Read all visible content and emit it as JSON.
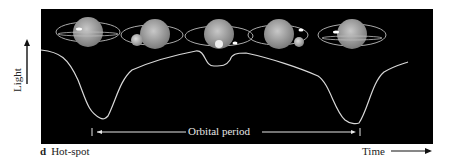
{
  "figure": {
    "panel_letter": "d",
    "caption": "Hot-spot",
    "y_axis_label": "Light",
    "x_axis_label": "Time",
    "period_label": "Orbital period",
    "colors": {
      "panel_bg": "#000000",
      "curve": "#d8d8d8",
      "planet": "#9a9a9a",
      "text": "#222222"
    }
  },
  "planets": [
    {
      "cx": 88,
      "cy": 32,
      "moon": "left-small",
      "label": "phase-1"
    },
    {
      "cx": 147,
      "cy": 35,
      "moon": "left",
      "label": "phase-2"
    },
    {
      "cx": 207,
      "cy": 32,
      "moon": "front",
      "label": "phase-3"
    },
    {
      "cx": 279,
      "cy": 35,
      "moon": "right",
      "label": "phase-4"
    },
    {
      "cx": 351,
      "cy": 35,
      "moon": "left-small",
      "label": "phase-5"
    }
  ],
  "light_curve": {
    "description": "Light vs time showing two deep minima separated by one orbital period, with a small secondary dip in between",
    "minima_x": [
      104,
      358
    ],
    "period_marks_x": [
      92,
      360
    ]
  }
}
